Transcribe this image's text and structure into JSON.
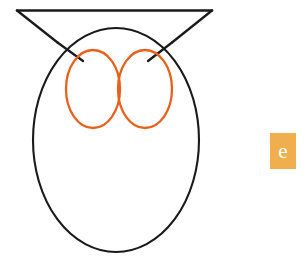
{
  "canvas": {
    "width": 306,
    "height": 259,
    "background_color": "#FFFFFF"
  },
  "artwork": {
    "name": "owl-line-drawing",
    "description": "Simple black line drawing of an owl: a wide inverted-V brow forming two ear tufts above an oval body, with two touching orange oval eyes",
    "stroke_color": "#1A1A1A",
    "eye_stroke_color": "#E8601C",
    "fill": "none",
    "parts": {
      "brow_label": "ear-tufts-brow",
      "body_label": "body-oval",
      "left_eye_label": "left-eye",
      "right_eye_label": "right-eye"
    }
  },
  "badge": {
    "letter": "e",
    "background_color": "#F0AE4E",
    "text_color": "#FFFFFF",
    "x": 270,
    "y": 133,
    "width": 26,
    "height": 36
  }
}
